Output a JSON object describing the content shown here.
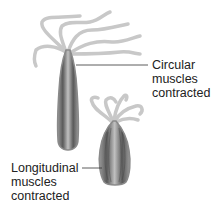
{
  "diagram": {
    "colors": {
      "tentacle": "#c8c8c8",
      "body_dark": "#555555",
      "body_light": "#a8a8a8",
      "outline": "#8a8a8a",
      "leader_line": "#333333",
      "text": "#222222"
    },
    "labels": [
      {
        "id": "circular",
        "lines": [
          "Circular",
          "muscles",
          "contracted"
        ]
      },
      {
        "id": "longitudinal",
        "lines": [
          "Longitudinal",
          "muscles",
          "contracted"
        ]
      }
    ],
    "figures": [
      {
        "id": "elongated-hydra",
        "state": "circular muscles contracted"
      },
      {
        "id": "shortened-hydra",
        "state": "longitudinal muscles contracted"
      }
    ]
  }
}
